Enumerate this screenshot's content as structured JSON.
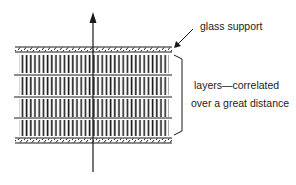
{
  "diagram": {
    "type": "schematic",
    "labels": {
      "glass_support": "glass support",
      "layers_line1": "layers—correlated",
      "layers_line2": "over a great distance"
    },
    "layer_count": 4,
    "colors": {
      "ink": "#1a1a1a",
      "background": "#ffffff"
    }
  }
}
